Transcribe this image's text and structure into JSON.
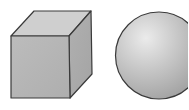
{
  "figure": {
    "shapes": [
      {
        "name": "cube",
        "kind": "cube"
      },
      {
        "name": "sphere",
        "kind": "sphere"
      }
    ],
    "colors": {
      "background": "#ffffff",
      "outline": "#3a3a3a",
      "cube_front": "#b4b4b4",
      "cube_top": "#cdcdcd",
      "cube_side": "#a8a8a8",
      "sphere_highlight": "#e6e6e6",
      "sphere_mid": "#c2c2c2",
      "sphere_shadow": "#9e9e9e"
    }
  }
}
